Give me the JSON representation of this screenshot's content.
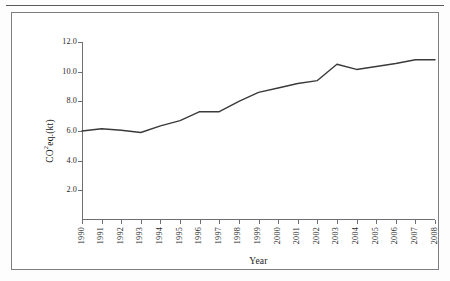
{
  "figure": {
    "background_color": "#ffffff",
    "frame_color": "#7d7d82",
    "rule_color": "#5b5b5b"
  },
  "chart_data": {
    "type": "line",
    "title": "",
    "xlabel": "Year",
    "ylabel": "CO2eq.(kt)",
    "ylabel_parts": {
      "prefix": "CO",
      "superscript": "2",
      "suffix": "eq.(kt)"
    },
    "categories": [
      "1990",
      "1991",
      "1992",
      "1993",
      "1994",
      "1995",
      "1996",
      "1997",
      "1998",
      "1999",
      "2000",
      "2001",
      "2002",
      "2003",
      "2004",
      "2005",
      "2006",
      "2007",
      "2008"
    ],
    "x": [
      1990,
      1991,
      1992,
      1993,
      1994,
      1995,
      1996,
      1997,
      1998,
      1999,
      2000,
      2001,
      2002,
      2003,
      2004,
      2005,
      2006,
      2007,
      2008
    ],
    "values": [
      6.0,
      6.15,
      6.05,
      5.9,
      6.35,
      6.7,
      7.3,
      7.3,
      8.0,
      8.6,
      8.9,
      9.2,
      9.4,
      10.5,
      10.15,
      10.35,
      10.55,
      10.8,
      10.8
    ],
    "series": [
      {
        "name": "CO2eq.(kt)",
        "color": "#3a3a3a",
        "values": [
          6.0,
          6.15,
          6.05,
          5.9,
          6.35,
          6.7,
          7.3,
          7.3,
          8.0,
          8.6,
          8.9,
          9.2,
          9.4,
          10.5,
          10.15,
          10.35,
          10.55,
          10.8,
          10.8
        ]
      }
    ],
    "ylim": [
      0.0,
      12.0
    ],
    "yticks": [
      12.0,
      10.0,
      8.0,
      6.0,
      4.0,
      2.0
    ],
    "ytick_labels": [
      "12.0",
      "10.0",
      "8.0",
      "6.0",
      "4.0",
      "2.0"
    ],
    "xlim": [
      1990,
      2008
    ],
    "grid": false,
    "legend": null,
    "legend_position": "none",
    "line_color": "#3a3a3a",
    "line_width": 1.4,
    "markers": false
  }
}
